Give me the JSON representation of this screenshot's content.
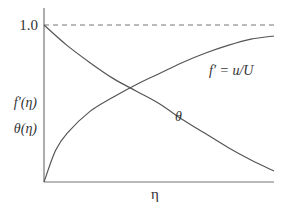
{
  "chart_data": {
    "type": "line",
    "title": "",
    "xlabel": "η",
    "ylabel_lines": [
      "f′(η)",
      "θ(η)"
    ],
    "ytick_labels": [
      "1.0"
    ],
    "yticks": [
      1.0
    ],
    "xlim": [
      0,
      1
    ],
    "ylim": [
      0,
      1
    ],
    "reference_line": {
      "y": 1.0,
      "style": "dashed"
    },
    "series": [
      {
        "name": "f′ = u/U",
        "label": "f′ = u/U",
        "x": [
          0,
          0.05,
          0.1,
          0.2,
          0.3,
          0.4,
          0.5,
          0.6,
          0.7,
          0.8,
          0.9,
          1.0
        ],
        "y": [
          0,
          0.2,
          0.31,
          0.45,
          0.54,
          0.62,
          0.69,
          0.76,
          0.82,
          0.87,
          0.91,
          0.93
        ]
      },
      {
        "name": "θ",
        "label": "θ",
        "x": [
          0,
          0.1,
          0.2,
          0.3,
          0.4,
          0.5,
          0.6,
          0.7,
          0.8,
          0.9,
          1.0
        ],
        "y": [
          1.0,
          0.87,
          0.76,
          0.66,
          0.58,
          0.5,
          0.4,
          0.31,
          0.22,
          0.14,
          0.07
        ]
      }
    ],
    "grid": false,
    "legend": "inline annotations"
  },
  "colors": {
    "line": "#555555",
    "axis": "#777777",
    "text": "#333333"
  }
}
